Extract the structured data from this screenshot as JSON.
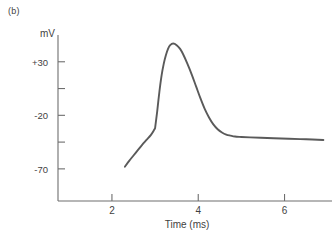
{
  "figure": {
    "panel_label": "(b)",
    "y_axis_unit": "mV",
    "x_axis_title": "Time (ms)",
    "line_color": "#5a5a5a",
    "axis_color": "#6e6e6e",
    "background_color": "#ffffff"
  },
  "chart_data": {
    "type": "line",
    "title": "",
    "subtitle": "",
    "xlabel": "Time (ms)",
    "ylabel": "mV",
    "xlim": [
      0.75,
      7.1
    ],
    "ylim": [
      -100,
      55
    ],
    "grid": false,
    "legend": null,
    "x_ticks": [
      2,
      4,
      6
    ],
    "x_tick_labels": [
      "2",
      "4",
      "6"
    ],
    "y_ticks": [
      30,
      5,
      -20,
      -45,
      -70
    ],
    "y_tick_labels": [
      "+30",
      "",
      "-20",
      "",
      "-70"
    ],
    "annotations": [],
    "series": [
      {
        "name": "membrane potential",
        "x": [
          2.3,
          2.4,
          2.5,
          2.6,
          2.7,
          2.8,
          2.9,
          2.98,
          3.0,
          3.05,
          3.1,
          3.15,
          3.2,
          3.25,
          3.3,
          3.35,
          3.42,
          3.5,
          3.58,
          3.65,
          3.75,
          3.85,
          3.95,
          4.05,
          4.15,
          4.25,
          4.35,
          4.45,
          4.55,
          4.65,
          4.75,
          4.85,
          5.0,
          5.2,
          5.45,
          5.75,
          6.1,
          6.5,
          6.9
        ],
        "y": [
          -68.0,
          -62.5,
          -57.5,
          -52.5,
          -47.5,
          -43.0,
          -38.5,
          -33.5,
          -32.0,
          -16.0,
          2.0,
          17.0,
          28.0,
          36.0,
          42.0,
          45.5,
          47.0,
          45.5,
          42.0,
          37.0,
          28.0,
          18.0,
          7.0,
          -4.0,
          -14.0,
          -22.0,
          -28.5,
          -33.0,
          -36.0,
          -38.0,
          -39.0,
          -39.8,
          -40.2,
          -40.6,
          -41.0,
          -41.4,
          -41.9,
          -42.4,
          -43.0
        ]
      }
    ]
  }
}
